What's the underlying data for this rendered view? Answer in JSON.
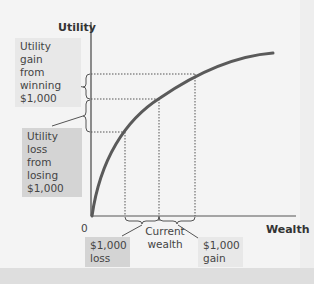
{
  "diagram": {
    "y_axis_label": "Utility",
    "x_axis_label": "Wealth",
    "origin_label": "0",
    "annotations": {
      "utility_gain": "Utility gain from winning $1,000",
      "utility_gain_lines": [
        "Utility gain",
        "from winning",
        "$1,000"
      ],
      "utility_loss_lines": [
        "Utility loss",
        "from losing",
        "$1,000"
      ],
      "current_wealth_lines": [
        "Current",
        "wealth"
      ],
      "loss_lines": [
        "$1,000",
        "loss"
      ],
      "gain_lines": [
        "$1,000",
        "gain"
      ]
    },
    "curve": "concave utility of wealth (diminishing marginal utility)",
    "points": {
      "wealth_levels": [
        "current wealth - $1,000",
        "current wealth",
        "current wealth + $1,000"
      ]
    },
    "colors": {
      "curve": "#555555",
      "axis": "#444444",
      "dotted": "#555555",
      "dark_box": "#d4d4d4",
      "light_box": "#e8e8e8"
    }
  }
}
